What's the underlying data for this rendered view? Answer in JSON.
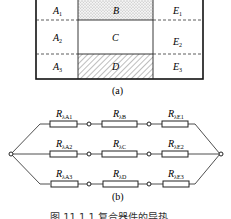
{
  "figure_a": {
    "caption": "(a)",
    "left_column": [
      "A1",
      "A2",
      "A3"
    ],
    "middle_column": [
      {
        "label": "B",
        "fill": "dotted"
      },
      {
        "label": "C",
        "fill": "none"
      },
      {
        "label": "D",
        "fill": "hatched"
      }
    ],
    "right_column": [
      "E1",
      "E2",
      "E3"
    ],
    "labels": {
      "A1": {
        "base": "A",
        "sub": "1"
      },
      "A2": {
        "base": "A",
        "sub": "2"
      },
      "A3": {
        "base": "A",
        "sub": "3"
      },
      "B": "B",
      "C": "C",
      "D": "D",
      "E1": {
        "base": "E",
        "sub": "1"
      },
      "E2": {
        "base": "E",
        "sub": "2"
      },
      "E3": {
        "base": "E",
        "sub": "3"
      }
    }
  },
  "figure_b": {
    "caption": "(b)",
    "branches": [
      [
        {
          "base": "R",
          "sub": "λA1"
        },
        {
          "base": "R",
          "sub": "λB"
        },
        {
          "base": "R",
          "sub": "λE1"
        }
      ],
      [
        {
          "base": "R",
          "sub": "λA2"
        },
        {
          "base": "R",
          "sub": "λC"
        },
        {
          "base": "R",
          "sub": "λE2"
        }
      ],
      [
        {
          "base": "R",
          "sub": "λA3"
        },
        {
          "base": "R",
          "sub": "λD"
        },
        {
          "base": "R",
          "sub": "λE3"
        }
      ]
    ],
    "r": {
      "a1": "λA1",
      "b": "λB",
      "e1": "λE1",
      "a2": "λA2",
      "c": "λC",
      "e2": "λE2",
      "a3": "λA3",
      "d": "λD",
      "e3": "λE3",
      "base": "R"
    }
  },
  "figure_caption": "图 11.1.1 复合器件的导热"
}
